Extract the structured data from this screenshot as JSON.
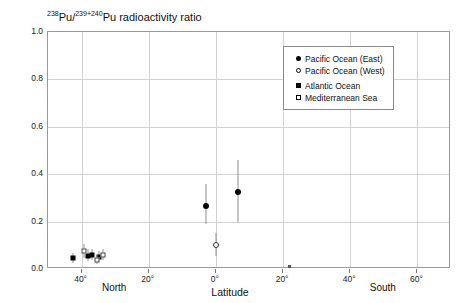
{
  "chart_data": {
    "type": "scatter",
    "title": "238Pu/239+240Pu radioactivity ratio",
    "title_parts": {
      "sup1": "238",
      "mid": "Pu/",
      "sup2": "239+240",
      "rest": "Pu radioactivity ratio"
    },
    "xlabel": "Latitude",
    "ylabel": "",
    "xlim": [
      50,
      -70
    ],
    "ylim": [
      0.0,
      1.0
    ],
    "grid": true,
    "legend_position": "top-right",
    "x_ticks": [
      {
        "value": 40,
        "label": "40°"
      },
      {
        "value": 20,
        "label": "20°"
      },
      {
        "value": 0,
        "label": "0°"
      },
      {
        "value": -20,
        "label": "20°"
      },
      {
        "value": -40,
        "label": "40°"
      },
      {
        "value": -60,
        "label": "60°"
      }
    ],
    "y_ticks": [
      {
        "value": 1.0,
        "label": "1.0"
      },
      {
        "value": 0.8,
        "label": "0.8"
      },
      {
        "value": 0.6,
        "label": "0.6"
      },
      {
        "value": 0.4,
        "label": "0.4"
      },
      {
        "value": 0.2,
        "label": "0.2"
      },
      {
        "value": 0.0,
        "label": "0.0"
      }
    ],
    "hemisphere_labels": [
      {
        "label": "North",
        "value": 30
      },
      {
        "label": "South",
        "value": -50
      }
    ],
    "series": [
      {
        "name": "Pacific Ocean (East)",
        "marker": "filled-circle",
        "points": [
          {
            "x": 3.0,
            "y": 0.265,
            "yerr_low": 0.075,
            "yerr_high": 0.095
          },
          {
            "x": -6.5,
            "y": 0.325,
            "yerr_low": 0.125,
            "yerr_high": 0.135
          }
        ]
      },
      {
        "name": "Pacific Ocean (West)",
        "marker": "open-circle",
        "points": [
          {
            "x": 0.0,
            "y": 0.1,
            "yerr_low": 0.045,
            "yerr_high": 0.05
          }
        ]
      },
      {
        "name": "Atlantic Ocean",
        "marker": "filled-square",
        "points": [
          {
            "x": 42.5,
            "y": 0.047,
            "yerr_low": 0.02,
            "yerr_high": 0.022
          },
          {
            "x": 38.0,
            "y": 0.055,
            "yerr_low": 0.022,
            "yerr_high": 0.03
          },
          {
            "x": 36.8,
            "y": 0.057,
            "yerr_low": 0.02,
            "yerr_high": 0.026
          },
          {
            "x": 34.8,
            "y": 0.052,
            "yerr_low": 0.018,
            "yerr_high": 0.022
          }
        ]
      },
      {
        "name": "Mediterranean Sea",
        "marker": "open-square",
        "points": [
          {
            "x": 39.2,
            "y": 0.075,
            "yerr_low": 0.03,
            "yerr_high": 0.032
          },
          {
            "x": 35.5,
            "y": 0.04,
            "yerr_low": 0.018,
            "yerr_high": 0.02
          },
          {
            "x": 33.5,
            "y": 0.06,
            "yerr_low": 0.022,
            "yerr_high": 0.025
          }
        ]
      }
    ],
    "colors": {
      "marker": "#000000",
      "grid": "#d2d2d2",
      "axis": "#9a9a9a",
      "errorbar": "#8d8d8d",
      "background": "#ffffff"
    }
  },
  "legend": {
    "entries": [
      {
        "label": "Pacific Ocean (East)",
        "marker": "filled-circle"
      },
      {
        "label": "Pacific Ocean (West)",
        "marker": "open-circle"
      },
      {
        "label": "Atlantic Ocean",
        "marker": "filled-square"
      },
      {
        "label": "Mediterranean Sea",
        "marker": "open-square"
      }
    ]
  }
}
